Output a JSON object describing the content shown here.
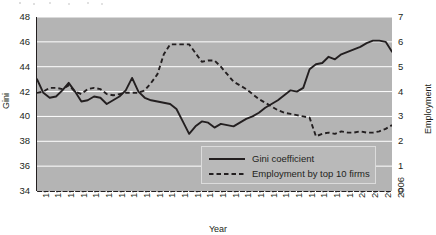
{
  "chart_data": {
    "type": "line",
    "title": "",
    "xlabel": "Year",
    "ylabel": "Gini",
    "ylabel_right": "Employment",
    "xlim": [
      1950,
      2006
    ],
    "ylim": [
      34,
      48
    ],
    "ylim_right": [
      0,
      7
    ],
    "yticks": [
      34,
      36,
      38,
      40,
      42,
      44,
      46,
      48
    ],
    "yticks_right": [
      0,
      1,
      2,
      3,
      4,
      5,
      6,
      7
    ],
    "grid": "horizontal-white",
    "legend_position": "bottom-right",
    "plot_background": "#b4b4b4",
    "gridline_color": "#ffffff",
    "line_color": "#231f20",
    "x": [
      1950,
      1951,
      1952,
      1953,
      1954,
      1955,
      1956,
      1957,
      1958,
      1959,
      1960,
      1961,
      1962,
      1963,
      1964,
      1965,
      1966,
      1967,
      1968,
      1969,
      1970,
      1971,
      1972,
      1973,
      1974,
      1975,
      1976,
      1977,
      1978,
      1979,
      1980,
      1981,
      1982,
      1983,
      1984,
      1985,
      1986,
      1987,
      1988,
      1989,
      1990,
      1991,
      1992,
      1993,
      1994,
      1995,
      1996,
      1997,
      1998,
      1999,
      2000,
      2001,
      2002,
      2003,
      2004,
      2005,
      2006
    ],
    "xtick_labels": [
      "1950",
      "1952",
      "1954",
      "1956",
      "1958",
      "1960",
      "1962",
      "1964",
      "1966",
      "1968",
      "1970",
      "1972",
      "1974",
      "1976",
      "1978",
      "1980",
      "1982",
      "1984",
      "1986",
      "1988",
      "1990",
      "1992",
      "1994",
      "1996",
      "1998",
      "2000",
      "2002",
      "2004",
      "2006"
    ],
    "series": [
      {
        "name": "Gini coefficient",
        "style": "solid",
        "axis": "left",
        "values": [
          43.0,
          41.9,
          41.5,
          41.6,
          42.1,
          42.7,
          42.0,
          41.2,
          41.3,
          41.6,
          41.5,
          41.0,
          41.3,
          41.6,
          42.1,
          43.1,
          42.0,
          41.5,
          41.3,
          41.2,
          41.1,
          41.0,
          40.6,
          39.6,
          38.6,
          39.2,
          39.6,
          39.5,
          39.1,
          39.4,
          39.3,
          39.2,
          39.5,
          39.8,
          40.0,
          40.3,
          40.7,
          41.0,
          41.3,
          41.7,
          42.1,
          42.0,
          42.3,
          43.8,
          44.2,
          44.3,
          44.8,
          44.6,
          45.0,
          45.2,
          45.4,
          45.6,
          45.9,
          46.1,
          46.1,
          46.0,
          45.2
        ]
      },
      {
        "name": "Employment by top 10 firms",
        "style": "dashed",
        "axis": "right",
        "values": [
          3.95,
          4.0,
          4.15,
          4.15,
          4.1,
          4.25,
          4.0,
          3.9,
          4.1,
          4.15,
          4.1,
          3.9,
          3.85,
          3.9,
          3.95,
          3.95,
          3.95,
          4.05,
          4.35,
          4.7,
          5.5,
          5.9,
          5.9,
          5.9,
          5.9,
          5.55,
          5.2,
          5.25,
          5.25,
          5.0,
          4.7,
          4.4,
          4.25,
          4.1,
          3.9,
          3.7,
          3.55,
          3.4,
          3.25,
          3.15,
          3.1,
          3.05,
          3.0,
          2.95,
          2.2,
          2.3,
          2.35,
          2.3,
          2.4,
          2.35,
          2.35,
          2.4,
          2.35,
          2.35,
          2.4,
          2.5,
          2.65
        ]
      }
    ]
  },
  "legend": {
    "items": [
      {
        "label": "Gini coefficient",
        "style": "solid"
      },
      {
        "label": "Employment by top 10 firms",
        "style": "dashed"
      }
    ]
  }
}
